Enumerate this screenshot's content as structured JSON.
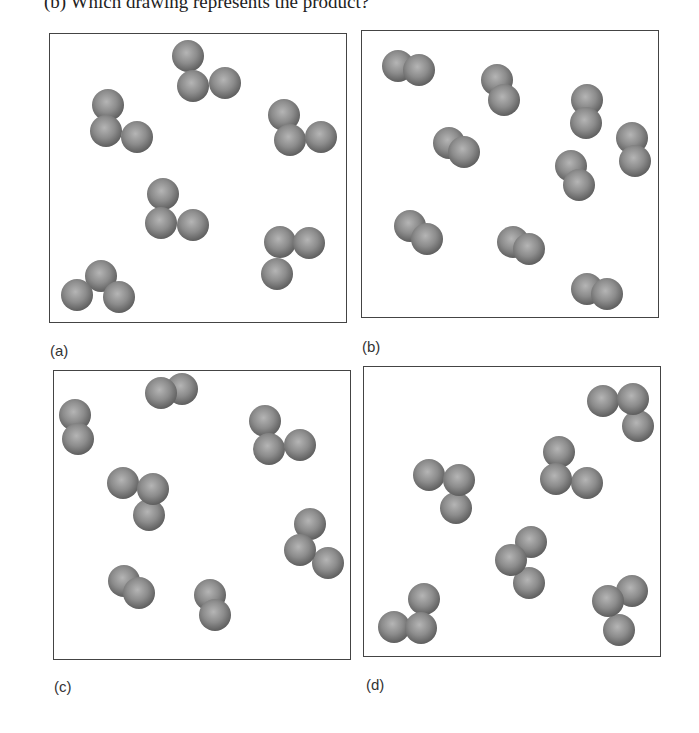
{
  "question": "(b)  Which drawing represents the product?",
  "sphere": {
    "radius": 16,
    "fill": "#8c8c8c",
    "highlight": "#b5b5b5",
    "shadow": "#5e5e5e"
  },
  "panels": [
    {
      "id": "a",
      "label": "(a)",
      "box": [
        49,
        33,
        298,
        290
      ],
      "label_pos": [
        50,
        342
      ],
      "molecules": [
        [
          [
            187,
            55
          ],
          [
            192,
            85
          ],
          [
            224,
            82
          ]
        ],
        [
          [
            107,
            104
          ],
          [
            105,
            130
          ],
          [
            136,
            136
          ]
        ],
        [
          [
            283,
            114
          ],
          [
            289,
            139
          ],
          [
            320,
            136
          ]
        ],
        [
          [
            162,
            193
          ],
          [
            160,
            222
          ],
          [
            192,
            224
          ]
        ],
        [
          [
            279,
            241
          ],
          [
            308,
            242
          ],
          [
            276,
            273
          ]
        ],
        [
          [
            100,
            275
          ],
          [
            76,
            294
          ],
          [
            118,
            296
          ]
        ]
      ]
    },
    {
      "id": "b",
      "label": "(b)",
      "box": [
        361,
        30,
        298,
        288
      ],
      "label_pos": [
        362,
        338
      ],
      "molecules": [
        [
          [
            397,
            65
          ],
          [
            418,
            69
          ]
        ],
        [
          [
            496,
            79
          ],
          [
            503,
            99
          ]
        ],
        [
          [
            586,
            99
          ],
          [
            585,
            122
          ]
        ],
        [
          [
            448,
            142
          ],
          [
            463,
            151
          ]
        ],
        [
          [
            631,
            137
          ],
          [
            634,
            160
          ]
        ],
        [
          [
            570,
            165
          ],
          [
            578,
            184
          ]
        ],
        [
          [
            409,
            225
          ],
          [
            426,
            238
          ]
        ],
        [
          [
            512,
            241
          ],
          [
            528,
            248
          ]
        ],
        [
          [
            586,
            288
          ],
          [
            606,
            293
          ]
        ]
      ]
    },
    {
      "id": "c",
      "label": "(c)",
      "box": [
        53,
        370,
        298,
        290
      ],
      "label_pos": [
        54,
        678
      ],
      "molecules": [
        [
          [
            74,
            414
          ],
          [
            77,
            438
          ]
        ],
        [
          [
            181,
            388
          ],
          [
            160,
            392
          ]
        ],
        [
          [
            264,
            420
          ],
          [
            268,
            448
          ],
          [
            299,
            444
          ]
        ],
        [
          [
            122,
            482
          ],
          [
            148,
            514
          ],
          [
            152,
            488
          ]
        ],
        [
          [
            309,
            523
          ],
          [
            327,
            562
          ],
          [
            299,
            549
          ]
        ],
        [
          [
            123,
            580
          ],
          [
            138,
            592
          ]
        ],
        [
          [
            209,
            594
          ],
          [
            214,
            614
          ]
        ]
      ]
    },
    {
      "id": "d",
      "label": "(d)",
      "box": [
        363,
        366,
        298,
        291
      ],
      "label_pos": [
        366,
        676
      ],
      "molecules": [
        [
          [
            602,
            400
          ],
          [
            637,
            425
          ],
          [
            632,
            398
          ]
        ],
        [
          [
            428,
            474
          ],
          [
            455,
            507
          ],
          [
            458,
            479
          ]
        ],
        [
          [
            558,
            451
          ],
          [
            586,
            482
          ],
          [
            555,
            478
          ]
        ],
        [
          [
            530,
            541
          ],
          [
            528,
            582
          ],
          [
            510,
            559
          ]
        ],
        [
          [
            423,
            598
          ],
          [
            393,
            626
          ],
          [
            420,
            627
          ]
        ],
        [
          [
            631,
            590
          ],
          [
            618,
            629
          ],
          [
            607,
            600
          ]
        ]
      ]
    }
  ]
}
